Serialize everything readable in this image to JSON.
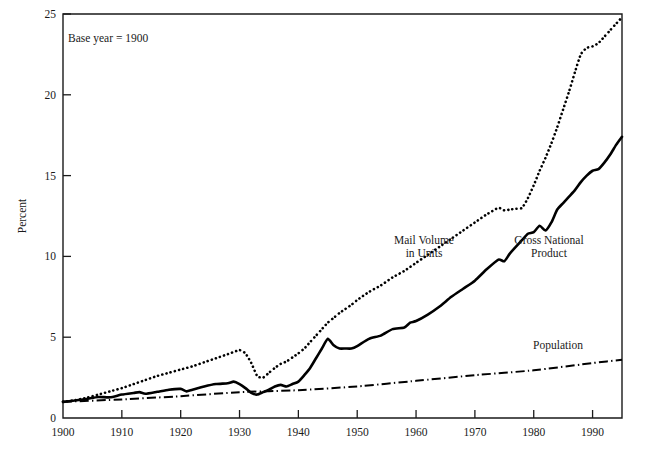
{
  "chart_data": {
    "type": "line",
    "title": "",
    "annotation": "Base year = 1900",
    "xlabel": "",
    "ylabel": "Percent",
    "xlim": [
      1900,
      1995
    ],
    "ylim": [
      0,
      25
    ],
    "grid": false,
    "legend_position": "inline-labels",
    "x_ticks": [
      1900,
      1910,
      1920,
      1930,
      1940,
      1950,
      1960,
      1970,
      1980,
      1990
    ],
    "x_tick_labels": [
      "1900",
      "1910",
      "1920",
      "1930",
      "1940",
      "1950",
      "1960",
      "1970",
      "1980",
      "1990"
    ],
    "y_ticks": [
      0,
      5,
      10,
      15,
      20,
      25
    ],
    "y_tick_labels": [
      "0",
      "5",
      "10",
      "15",
      "20",
      "25"
    ],
    "series": [
      {
        "name": "Mail Volume in Units",
        "label": "Mail Volume\nin Units",
        "label_line1": "Mail Volume",
        "label_line2": "in Units",
        "style": "dotted",
        "color": "#000000",
        "x": [
          1900,
          1902,
          1904,
          1906,
          1908,
          1910,
          1912,
          1914,
          1916,
          1918,
          1920,
          1922,
          1924,
          1926,
          1928,
          1930,
          1931,
          1932,
          1933,
          1934,
          1935,
          1936,
          1937,
          1938,
          1939,
          1940,
          1941,
          1942,
          1943,
          1944,
          1945,
          1946,
          1947,
          1948,
          1949,
          1950,
          1952,
          1954,
          1956,
          1958,
          1960,
          1962,
          1964,
          1966,
          1968,
          1970,
          1972,
          1974,
          1975,
          1976,
          1977,
          1978,
          1979,
          1980,
          1981,
          1982,
          1983,
          1984,
          1985,
          1986,
          1987,
          1988,
          1989,
          1990,
          1991,
          1992,
          1993,
          1994,
          1995
        ],
        "values": [
          1.0,
          1.1,
          1.25,
          1.45,
          1.65,
          1.85,
          2.1,
          2.35,
          2.6,
          2.8,
          3.0,
          3.2,
          3.45,
          3.7,
          3.95,
          4.2,
          4.0,
          3.4,
          2.6,
          2.5,
          2.8,
          3.1,
          3.35,
          3.5,
          3.75,
          4.0,
          4.3,
          4.7,
          5.1,
          5.5,
          5.9,
          6.2,
          6.5,
          6.75,
          7.0,
          7.3,
          7.8,
          8.2,
          8.7,
          9.1,
          9.6,
          10.1,
          10.6,
          11.1,
          11.6,
          12.1,
          12.6,
          13.0,
          12.85,
          12.9,
          12.95,
          13.0,
          13.6,
          14.4,
          15.3,
          16.1,
          17.0,
          18.0,
          19.1,
          20.2,
          21.4,
          22.5,
          22.9,
          23.0,
          23.2,
          23.6,
          24.0,
          24.4,
          24.8
        ]
      },
      {
        "name": "Gross National Product",
        "label": "Gross National\nProduct",
        "label_line1": "Gross National",
        "label_line2": "Product",
        "style": "solid",
        "color": "#000000",
        "x": [
          1900,
          1902,
          1904,
          1906,
          1908,
          1910,
          1912,
          1913,
          1914,
          1916,
          1918,
          1920,
          1921,
          1922,
          1924,
          1926,
          1928,
          1929,
          1930,
          1931,
          1932,
          1933,
          1934,
          1935,
          1936,
          1937,
          1938,
          1939,
          1940,
          1941,
          1942,
          1943,
          1944,
          1945,
          1946,
          1947,
          1948,
          1949,
          1950,
          1952,
          1954,
          1956,
          1958,
          1959,
          1960,
          1962,
          1964,
          1966,
          1968,
          1970,
          1972,
          1974,
          1975,
          1976,
          1978,
          1979,
          1980,
          1981,
          1982,
          1983,
          1984,
          1985,
          1986,
          1987,
          1988,
          1989,
          1990,
          1991,
          1992,
          1993,
          1994,
          1995
        ],
        "values": [
          1.0,
          1.08,
          1.18,
          1.3,
          1.28,
          1.45,
          1.55,
          1.6,
          1.5,
          1.62,
          1.75,
          1.8,
          1.65,
          1.75,
          1.95,
          2.1,
          2.15,
          2.25,
          2.1,
          1.85,
          1.55,
          1.45,
          1.6,
          1.75,
          1.95,
          2.05,
          1.95,
          2.1,
          2.25,
          2.65,
          3.1,
          3.7,
          4.3,
          4.9,
          4.5,
          4.3,
          4.3,
          4.3,
          4.45,
          4.9,
          5.1,
          5.5,
          5.6,
          5.9,
          6.0,
          6.4,
          6.9,
          7.5,
          8.0,
          8.5,
          9.2,
          9.8,
          9.7,
          10.2,
          11.0,
          11.4,
          11.5,
          11.9,
          11.6,
          12.1,
          12.9,
          13.3,
          13.7,
          14.1,
          14.6,
          15.0,
          15.3,
          15.4,
          15.8,
          16.3,
          16.9,
          17.4
        ]
      },
      {
        "name": "Population",
        "label": "Population",
        "label_line1": "Population",
        "label_line2": "",
        "style": "dashdot",
        "color": "#000000",
        "x": [
          1900,
          1910,
          1920,
          1930,
          1940,
          1950,
          1960,
          1970,
          1980,
          1990,
          1995
        ],
        "values": [
          1.0,
          1.15,
          1.35,
          1.6,
          1.72,
          1.95,
          2.3,
          2.65,
          2.95,
          3.4,
          3.6
        ]
      }
    ]
  },
  "layout": {
    "plot_left": 63,
    "plot_right": 622,
    "plot_top": 14,
    "plot_bottom": 418,
    "annotation_x": 68,
    "annotation_y": 42,
    "ylabel_x": 26,
    "ylabel_y": 216,
    "labels": {
      "mail_volume": {
        "x": 424,
        "y": 244,
        "line_height": 13
      },
      "gnp": {
        "x": 549,
        "y": 244,
        "line_height": 13
      },
      "population": {
        "x": 558,
        "y": 349,
        "line_height": 13
      }
    }
  }
}
